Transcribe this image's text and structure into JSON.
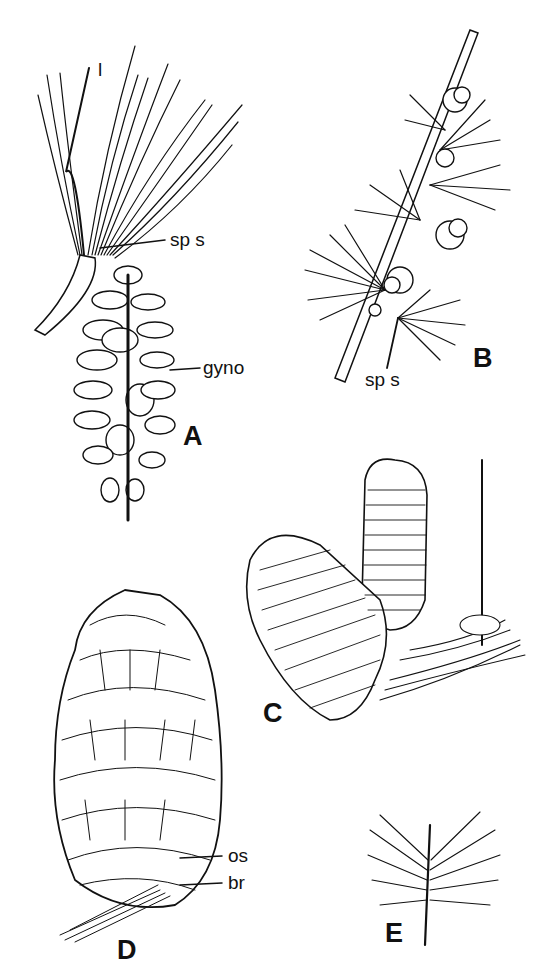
{
  "figure": {
    "panels": [
      {
        "id": "A",
        "label": "A",
        "description": "pine branch with needle fascicles and pendant cone",
        "annotations": [
          "l",
          "sp s",
          "gyno"
        ]
      },
      {
        "id": "B",
        "label": "B",
        "description": "larch twig with clustered needles on spur shoots and small cones",
        "annotations": [
          "sp s"
        ]
      },
      {
        "id": "C",
        "label": "C",
        "description": "pair of upright fir-like cones with needled twig",
        "annotations": []
      },
      {
        "id": "D",
        "label": "D",
        "description": "ovulate cone with scale detail",
        "annotations": [
          "os",
          "br"
        ]
      },
      {
        "id": "E",
        "label": "E",
        "description": "short needled shoot",
        "annotations": []
      }
    ],
    "labels": {
      "A_l": "l",
      "A_sps": "sp s",
      "A_gyno": "gyno",
      "A": "A",
      "B_sps": "sp s",
      "B": "B",
      "C": "C",
      "D_os": "os",
      "D_br": "br",
      "D": "D",
      "E": "E"
    }
  }
}
